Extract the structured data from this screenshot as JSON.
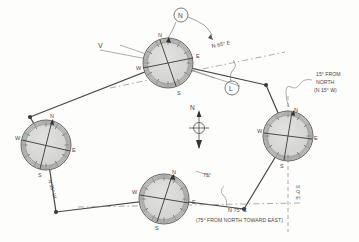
{
  "figure": {
    "ink_color": "#444444",
    "light_ink_color": "#8a8a8a",
    "dial_fill": "#d8d8d6",
    "paper_color": "#fdfdfc"
  },
  "annotations": {
    "bearing_top": "N 65° E",
    "bearing_bottom": "N 75° E",
    "bearing_bottom_note": "(75° FROM NORTH TOWARD EAST)",
    "note_right_line1": "15° FROM",
    "note_right_line2": "NORTH",
    "note_right_line3": "(N 15° W)",
    "angle_bottom": "75°",
    "bearing_right_vertical": "S 0° E",
    "bearing_left_rotated": "N 35° W",
    "label_v": "V",
    "callout_n": "N",
    "callout_l": "L",
    "north_arrow_label": "N"
  },
  "compass_roses": [
    {
      "name": "rose-top",
      "cx": 168,
      "cy": 63,
      "r": 25,
      "cardinals": {
        "n": "N",
        "e": "E",
        "s": "S",
        "w": "W"
      }
    },
    {
      "name": "rose-left",
      "cx": 46,
      "cy": 145,
      "r": 25,
      "cardinals": {
        "n": "N",
        "e": "E",
        "s": "S",
        "w": "W"
      }
    },
    {
      "name": "rose-right",
      "cx": 288,
      "cy": 136,
      "r": 25,
      "cardinals": {
        "n": "N",
        "e": "E",
        "s": "S",
        "w": "W"
      }
    },
    {
      "name": "rose-bottom",
      "cx": 164,
      "cy": 199,
      "r": 25,
      "cardinals": {
        "n": "N",
        "e": "E",
        "s": "S",
        "w": "W"
      }
    }
  ],
  "traverse": {
    "vertices": [
      {
        "name": "vertex-west",
        "x": 30,
        "y": 117
      },
      {
        "name": "vertex-north",
        "x": 266,
        "y": 85
      },
      {
        "name": "vertex-south",
        "x": 244,
        "y": 209
      },
      {
        "name": "vertex-southwest",
        "x": 56,
        "y": 212
      }
    ]
  }
}
